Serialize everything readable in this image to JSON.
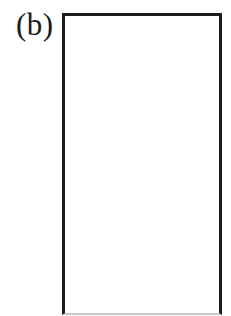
{
  "figure": {
    "panel_label": "(b)",
    "label_color": "#1a1a1a",
    "box": {
      "border_color": "#1c1c1c",
      "bottom_edge_color": "#c9c9c9",
      "fill": "#ffffff"
    },
    "background": "#ffffff"
  }
}
